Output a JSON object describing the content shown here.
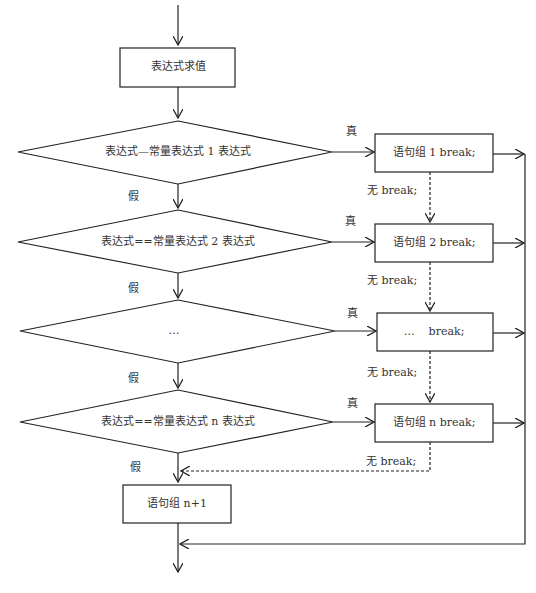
{
  "diagram": {
    "type": "flowchart",
    "start_box": {
      "label": "表达式求值"
    },
    "conditions": [
      {
        "label": "表达式—常量表达式 1 表达式",
        "true_label": "真",
        "false_label": "假"
      },
      {
        "label": "表达式==常量表达式 2 表达式",
        "true_label": "真",
        "false_label": "假"
      },
      {
        "label": "…",
        "true_label": "真",
        "false_label": "假"
      },
      {
        "label": "表达式==常量表达式 n 表达式",
        "true_label": "真",
        "false_label": "假"
      }
    ],
    "statement_boxes": [
      {
        "label": "语句组 1 break;"
      },
      {
        "label": "语句组 2 break;"
      },
      {
        "label": "…    break;"
      },
      {
        "label": "语句组 n break;"
      }
    ],
    "no_break_labels": [
      "无 break;",
      "无 break;",
      "无 break;",
      "无 break;"
    ],
    "default_box": {
      "label": "语句组 n+1"
    },
    "colors": {
      "line": "#222222",
      "text": "#333333",
      "background": "#ffffff"
    }
  }
}
